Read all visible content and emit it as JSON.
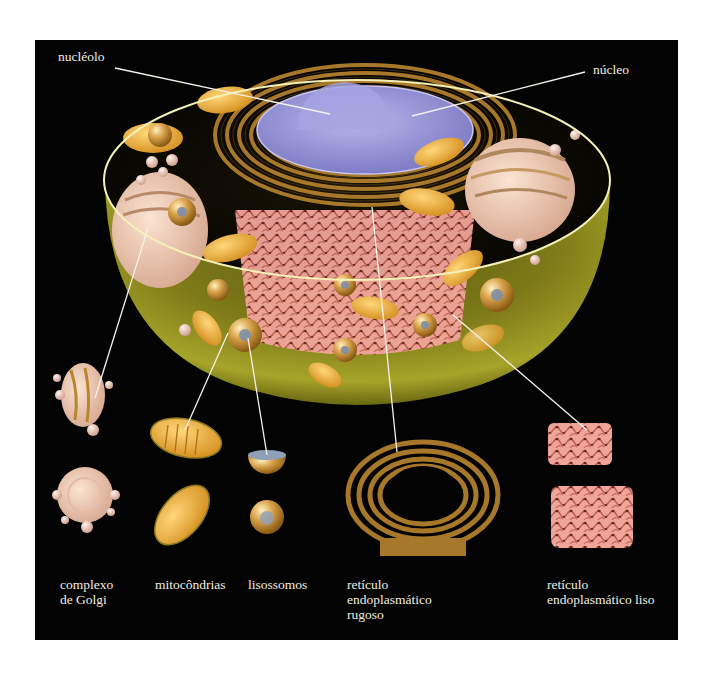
{
  "figure": {
    "background": "#030303",
    "label_color": "#f2ece0",
    "colors": {
      "cytoplasm": "#8d8a1c",
      "membrane_rim": "#f3f0b8",
      "nucleus": "#9a98d8",
      "rough_er": "#a8782a",
      "smooth_er": "#e89a90",
      "mitochondria": "#f2b640",
      "golgi": "#f0c9b0",
      "lysosome": "#d9a24a"
    }
  },
  "labels": {
    "nucleolo": "nucléolo",
    "nucleo": "núcleo",
    "golgi": [
      "complexo",
      "de Golgi"
    ],
    "mitocondrias": "mitocôndrias",
    "lisossomos": "lisossomos",
    "rer": [
      "retículo",
      "endoplasmático",
      "rugoso"
    ],
    "ser": [
      "retículo",
      "endoplasmático liso"
    ]
  }
}
